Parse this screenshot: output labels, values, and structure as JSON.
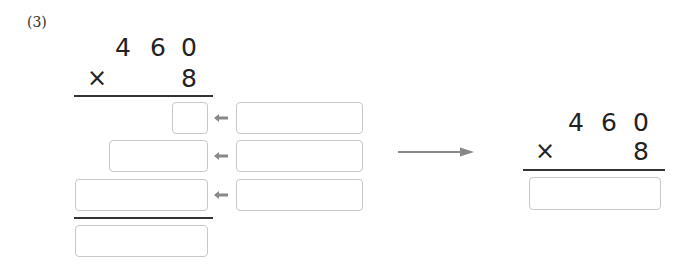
{
  "problem": {
    "label": "(3)",
    "multiplicand_digits": [
      "4",
      "6",
      "0"
    ],
    "multiplier_symbol": "×",
    "multiplier": "8"
  },
  "partial_products": {
    "left_boxes": [
      {
        "row": 1,
        "value": ""
      },
      {
        "row": 2,
        "value": ""
      },
      {
        "row": 3,
        "value": ""
      }
    ],
    "right_boxes": [
      {
        "row": 1,
        "value": ""
      },
      {
        "row": 2,
        "value": ""
      },
      {
        "row": 3,
        "value": ""
      }
    ],
    "sum_box": {
      "value": ""
    }
  },
  "result": {
    "multiplicand_digits": [
      "4",
      "6",
      "0"
    ],
    "multiplier_symbol": "×",
    "multiplier": "8",
    "answer_box": {
      "value": ""
    }
  },
  "icons": {
    "small_arrow": "left-arrow-icon",
    "big_arrow": "right-arrow-icon"
  },
  "colors": {
    "box_border": "#c8c8c8",
    "arrow": "#888888",
    "rule": "#333333"
  }
}
